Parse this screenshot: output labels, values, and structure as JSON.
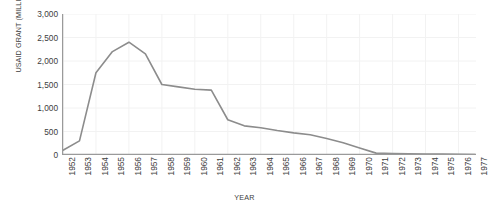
{
  "chart_data": {
    "type": "line",
    "title": "",
    "xlabel": "YEAR",
    "ylabel": "USAID GRANT (MILLION USD)",
    "categories": [
      "1952",
      "1953",
      "1954",
      "1955",
      "1956",
      "1957",
      "1958",
      "1959",
      "1960",
      "1961",
      "1962",
      "1963",
      "1964",
      "1965",
      "1966",
      "1967",
      "1968",
      "1969",
      "1970",
      "1971",
      "1972",
      "1973",
      "1974",
      "1975",
      "1976",
      "1977"
    ],
    "values": [
      100,
      300,
      1750,
      2200,
      2400,
      2150,
      1500,
      1450,
      1400,
      1380,
      750,
      620,
      580,
      520,
      470,
      430,
      350,
      260,
      150,
      40,
      30,
      25,
      20,
      18,
      15,
      12
    ],
    "series": [
      {
        "name": "USAID Grant",
        "color": "#8c8c8c",
        "values": [
          100,
          300,
          1750,
          2200,
          2400,
          2150,
          1500,
          1450,
          1400,
          1380,
          750,
          620,
          580,
          520,
          470,
          430,
          350,
          260,
          150,
          40,
          30,
          25,
          20,
          18,
          15,
          12
        ]
      }
    ],
    "ylim": [
      0,
      3000
    ],
    "yticks": [
      0,
      500,
      1000,
      1500,
      2000,
      2500,
      3000
    ],
    "ytick_labels": [
      "0",
      "500",
      "1,000",
      "1,500",
      "2,000",
      "2,500",
      "3,000"
    ],
    "xlim": [
      "1952",
      "1977"
    ],
    "grid": true,
    "grid_color": "#f2f2f2",
    "axis_color": "#9a9a9a",
    "legend": "none",
    "background": "#ffffff"
  }
}
